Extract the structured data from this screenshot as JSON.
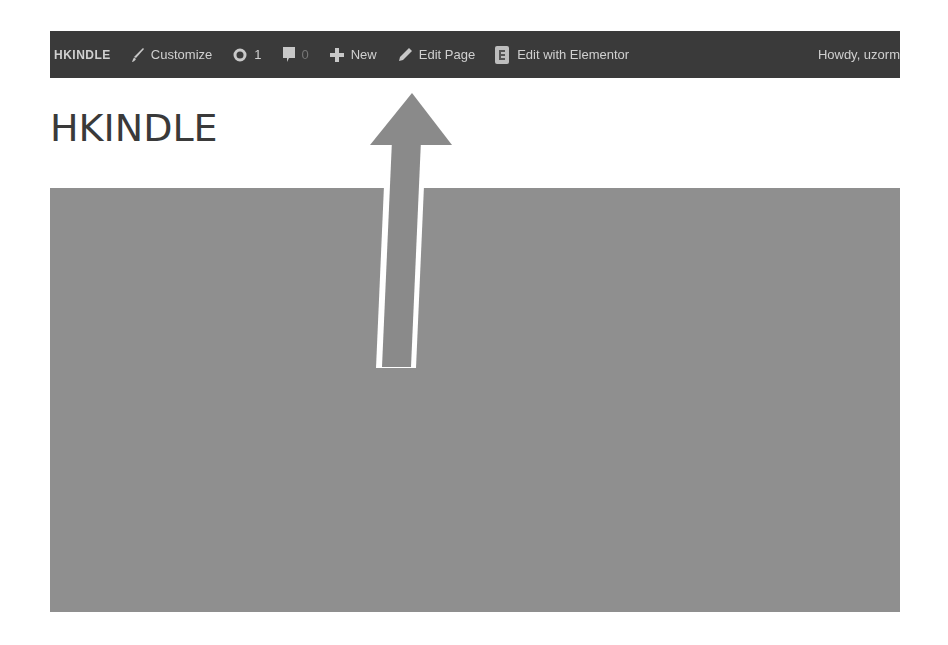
{
  "admin_bar": {
    "site_name": "HKINDLE",
    "customize_label": "Customize",
    "updates_count": "1",
    "comments_count": "0",
    "new_label": "New",
    "edit_page_label": "Edit Page",
    "edit_elementor_label": "Edit with Elementor",
    "howdy_label": "Howdy, uzorm",
    "icons": {
      "customize": "brush-icon",
      "updates": "updates-icon",
      "comments": "comment-bubble-icon",
      "new": "plus-icon",
      "edit_page": "pencil-icon",
      "elementor": "elementor-icon"
    }
  },
  "page": {
    "site_title": "HKINDLE"
  },
  "annotation": {
    "type": "arrow-up",
    "pointing_to": "admin-bar-new",
    "color": "#8a8a8a",
    "outline_color": "#ffffff"
  },
  "colors": {
    "admin_bar_bg": "#3a3a3a",
    "admin_bar_text": "#d0d0d0",
    "hero_bg": "#8f8f8f",
    "title_text": "#3a3a3a"
  }
}
